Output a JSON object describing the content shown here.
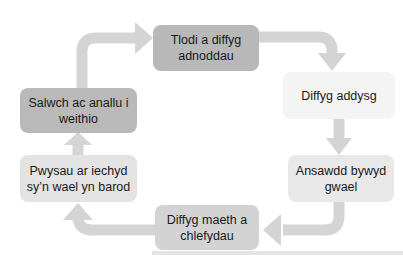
{
  "diagram": {
    "type": "cycle",
    "direction": "clockwise",
    "nodes": [
      {
        "id": "top",
        "label": "Tlodi a diffyg adnoddau",
        "fill": "#b8b8b8"
      },
      {
        "id": "right-top",
        "label": "Diffyg addysg",
        "fill": "#f4f4f4"
      },
      {
        "id": "right-bottom",
        "label": "Ansawdd bywyd gwael",
        "fill": "#e8e8e8"
      },
      {
        "id": "bottom",
        "label": "Diffyg maeth a chlefydau",
        "fill": "#d3d3d3"
      },
      {
        "id": "left-bottom",
        "label": "Pwysau ar iechyd sy’n wael yn barod",
        "fill": "#e3e3e3"
      },
      {
        "id": "left-top",
        "label": "Salwch ac anallu i weithio",
        "fill": "#b9b9b9"
      }
    ],
    "edges": [
      {
        "from": "top",
        "to": "right-top"
      },
      {
        "from": "right-top",
        "to": "right-bottom"
      },
      {
        "from": "right-bottom",
        "to": "bottom"
      },
      {
        "from": "bottom",
        "to": "left-bottom"
      },
      {
        "from": "left-bottom",
        "to": "left-top"
      },
      {
        "from": "left-top",
        "to": "top"
      }
    ],
    "arrow_color": "#d4d4d4"
  }
}
